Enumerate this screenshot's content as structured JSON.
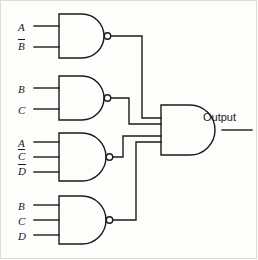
{
  "diagram": {
    "type": "logic-gate-schematic",
    "line_color": "#1a1a1a",
    "background_color": "#fdfdfb",
    "output_label": "Output",
    "gates": [
      {
        "id": "nand-1",
        "type": "NAND",
        "inputs": [
          {
            "label": "A",
            "overbar": false
          },
          {
            "label": "B",
            "overbar": true
          }
        ]
      },
      {
        "id": "nand-2",
        "type": "NAND",
        "inputs": [
          {
            "label": "B",
            "overbar": false
          },
          {
            "label": "C",
            "overbar": false
          }
        ]
      },
      {
        "id": "nand-3",
        "type": "NAND",
        "inputs": [
          {
            "label": "A",
            "overbar": false
          },
          {
            "label": "C",
            "overbar": true
          },
          {
            "label": "D",
            "overbar": true
          }
        ]
      },
      {
        "id": "nand-4",
        "type": "NAND",
        "inputs": [
          {
            "label": "B",
            "overbar": false
          },
          {
            "label": "C",
            "overbar": false
          },
          {
            "label": "D",
            "overbar": false
          }
        ]
      },
      {
        "id": "and-output",
        "type": "AND",
        "inputs": [
          {
            "from": "nand-1"
          },
          {
            "from": "nand-2"
          },
          {
            "from": "nand-3"
          },
          {
            "from": "nand-4"
          }
        ]
      }
    ],
    "labels": {
      "g1_in1": "A",
      "g1_in2": "B",
      "g2_in1": "B",
      "g2_in2": "C",
      "g3_in1": "A",
      "g3_in2": "C",
      "g3_in3": "D",
      "g4_in1": "B",
      "g4_in2": "C",
      "g4_in3": "D"
    }
  }
}
